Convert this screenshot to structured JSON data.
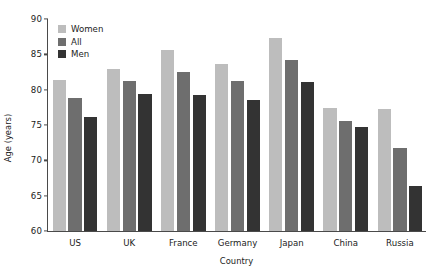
{
  "chart_data": {
    "type": "bar",
    "title": "",
    "xlabel": "Country",
    "ylabel": "Age (years)",
    "categories": [
      "US",
      "UK",
      "France",
      "Germany",
      "Japan",
      "China",
      "Russia"
    ],
    "series": [
      {
        "name": "Women",
        "color": "#bdbdbd",
        "values": [
          81.3,
          82.9,
          85.6,
          83.6,
          87.3,
          77.4,
          77.3
        ]
      },
      {
        "name": "All",
        "color": "#6e6e6e",
        "values": [
          78.8,
          81.2,
          82.5,
          81.2,
          84.2,
          75.6,
          71.8
        ]
      },
      {
        "name": "Men",
        "color": "#333333",
        "values": [
          76.1,
          79.4,
          79.3,
          78.6,
          81.1,
          74.7,
          66.4
        ]
      }
    ],
    "ylim": [
      60,
      90
    ],
    "yticks": [
      60,
      65,
      70,
      75,
      80,
      85,
      90
    ],
    "ytick_labels": [
      "60",
      "65",
      "70",
      "75",
      "80",
      "85",
      "90"
    ],
    "grid": false,
    "legend_position": "top-left",
    "axis_color": "#4a4a4a",
    "text_color": "#1b1b1b",
    "background": "#ffffff"
  }
}
